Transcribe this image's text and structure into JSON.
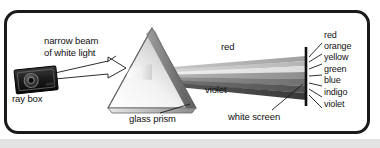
{
  "figure": {
    "background_color": "#ffffff",
    "frame_color": "#1a1a1a",
    "bottom_band_color": "#e3e3e3"
  },
  "labels": {
    "narrow_beam_line1": "narrow beam",
    "narrow_beam_line2": "of white light",
    "ray_box": "ray box",
    "glass_prism": "glass prism",
    "red_beam": "red",
    "violet_beam": "violet",
    "white_screen": "white screen"
  },
  "spectrum": {
    "colors": [
      {
        "name": "red",
        "label": "red",
        "hex": "#b0b0b0"
      },
      {
        "name": "orange",
        "label": "orange",
        "hex": "#9e9e9e"
      },
      {
        "name": "yellow",
        "label": "yellow",
        "hex": "#d6d6d6"
      },
      {
        "name": "green",
        "label": "green",
        "hex": "#8a8a8a"
      },
      {
        "name": "blue",
        "label": "blue",
        "hex": "#6e6e6e"
      },
      {
        "name": "indigo",
        "label": "indigo",
        "hex": "#555555"
      },
      {
        "name": "violet",
        "label": "violet",
        "hex": "#3d3d3d"
      }
    ]
  },
  "objects": {
    "ray_box_name": "ray-box",
    "prism_name": "glass-prism",
    "screen_name": "white-screen"
  }
}
